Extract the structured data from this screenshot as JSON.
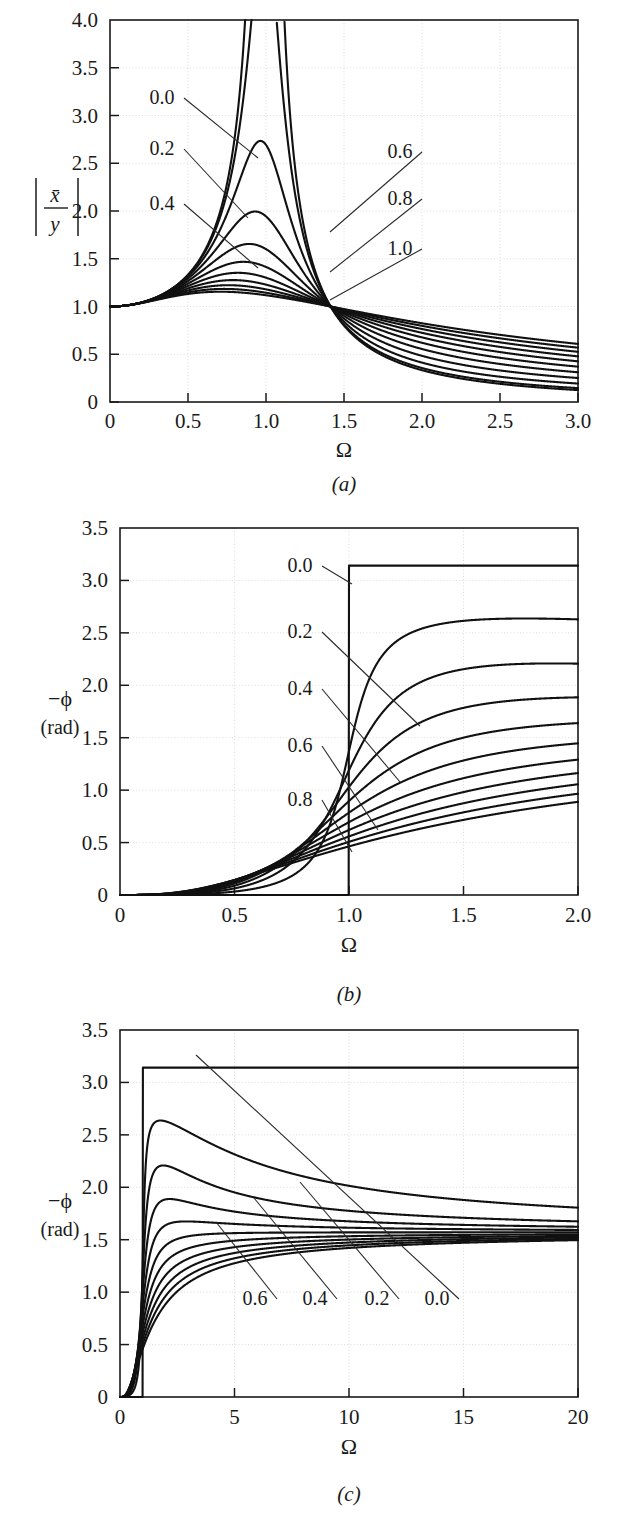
{
  "figure": {
    "name": "displacement-transmissibility-figure",
    "panel_count": 3
  },
  "chart_data": [
    {
      "id": "a",
      "type": "line",
      "title": "",
      "caption": "(a)",
      "xlabel": "Ω",
      "ylabel": "|x̄/y|",
      "ylabel_parts": {
        "numerator": "x̄",
        "denominator": "y"
      },
      "xlim": [
        0,
        3.0
      ],
      "ylim": [
        0,
        4.0
      ],
      "xticks": [
        0,
        0.5,
        1.0,
        1.5,
        2.0,
        2.5,
        3.0
      ],
      "xtick_labels": [
        "0",
        "0.5",
        "1.0",
        "1.5",
        "2.0",
        "2.5",
        "3.0"
      ],
      "yticks": [
        0,
        0.5,
        1.0,
        1.5,
        2.0,
        2.5,
        3.0,
        3.5,
        4.0
      ],
      "ytick_labels": [
        "0",
        "0.5",
        "1.0",
        "1.5",
        "2.0",
        "2.5",
        "3.0",
        "3.5",
        "4.0"
      ],
      "grid": true,
      "legend": "inline-labels",
      "curve_param_name": "ζ",
      "curve_params": [
        0.0,
        0.1,
        0.2,
        0.3,
        0.4,
        0.5,
        0.6,
        0.7,
        0.8,
        0.9,
        1.0
      ],
      "formula": "transmissibility",
      "annotations": [
        {
          "label": "0.0",
          "x": 162,
          "y": 104,
          "lead_to_x": 258,
          "lead_to_y": 158
        },
        {
          "label": "0.2",
          "x": 162,
          "y": 155,
          "lead_to_x": 248,
          "lead_to_y": 218
        },
        {
          "label": "0.4",
          "x": 162,
          "y": 210,
          "lead_to_x": 258,
          "lead_to_y": 268
        },
        {
          "label": "0.6",
          "x": 400,
          "y": 158,
          "lead_to_x": 330,
          "lead_to_y": 232
        },
        {
          "label": "0.8",
          "x": 400,
          "y": 205,
          "lead_to_x": 330,
          "lead_to_y": 272
        },
        {
          "label": "1.0",
          "x": 400,
          "y": 255,
          "lead_to_x": 330,
          "lead_to_y": 300
        }
      ],
      "notes": "Magnitude of displacement transmissibility; all curves pass through 1.0 at Ω=0 and cross at Ω=√2≈1.414 where ratio = 1."
    },
    {
      "id": "b",
      "type": "line",
      "title": "",
      "caption": "(b)",
      "xlabel": "Ω",
      "ylabel": "−ϕ",
      "ylabel_unit": "(rad)",
      "xlim": [
        0,
        2.0
      ],
      "ylim": [
        0,
        3.5
      ],
      "xticks": [
        0,
        0.5,
        1.0,
        1.5,
        2.0
      ],
      "xtick_labels": [
        "0",
        "0.5",
        "1.0",
        "1.5",
        "2.0"
      ],
      "yticks": [
        0,
        0.5,
        1.0,
        1.5,
        2.0,
        2.5,
        3.0,
        3.5
      ],
      "ytick_labels": [
        "0",
        "0.5",
        "1.0",
        "1.5",
        "2.0",
        "2.5",
        "3.0",
        "3.5"
      ],
      "grid": true,
      "legend": "inline-labels",
      "curve_param_name": "ζ",
      "curve_params": [
        0.0,
        0.1,
        0.2,
        0.3,
        0.4,
        0.5,
        0.6,
        0.7,
        0.8,
        0.9,
        1.0
      ],
      "formula": "phase",
      "annotations": [
        {
          "label": "0.0",
          "x": 300,
          "y": 572,
          "lead_to_x": 352,
          "lead_to_y": 584
        },
        {
          "label": "0.2",
          "x": 300,
          "y": 638,
          "lead_to_x": 420,
          "lead_to_y": 726
        },
        {
          "label": "0.4",
          "x": 300,
          "y": 695,
          "lead_to_x": 400,
          "lead_to_y": 782
        },
        {
          "label": "0.6",
          "x": 300,
          "y": 752,
          "lead_to_x": 378,
          "lead_to_y": 830
        },
        {
          "label": "0.8",
          "x": 300,
          "y": 806,
          "lead_to_x": 352,
          "lead_to_y": 852
        }
      ],
      "notes": "Phase angle of transmissibility in radians; undamped case is a step from 0 to π at Ω=1."
    },
    {
      "id": "c",
      "type": "line",
      "title": "",
      "caption": "(c)",
      "xlabel": "Ω",
      "ylabel": "−ϕ",
      "ylabel_unit": "(rad)",
      "xlim": [
        0,
        20
      ],
      "ylim": [
        0,
        3.5
      ],
      "xticks": [
        0,
        5,
        10,
        15,
        20
      ],
      "xtick_labels": [
        "0",
        "5",
        "10",
        "15",
        "20"
      ],
      "yticks": [
        0,
        0.5,
        1.0,
        1.5,
        2.0,
        2.5,
        3.0,
        3.5
      ],
      "ytick_labels": [
        "0",
        "0.5",
        "1.0",
        "1.5",
        "2.0",
        "2.5",
        "3.0",
        "3.5"
      ],
      "grid": true,
      "legend": "inline-labels",
      "curve_param_name": "ζ",
      "curve_params": [
        0.0,
        0.1,
        0.2,
        0.3,
        0.4,
        0.5,
        0.6,
        0.7,
        0.8,
        0.9,
        1.0
      ],
      "formula": "phase",
      "annotations": [
        {
          "label": "0.6",
          "x": 255,
          "y": 1305,
          "lead_to_x": 216,
          "lead_to_y": 1222
        },
        {
          "label": "0.4",
          "x": 315,
          "y": 1305,
          "lead_to_x": 254,
          "lead_to_y": 1198
        },
        {
          "label": "0.2",
          "x": 377,
          "y": 1305,
          "lead_to_x": 300,
          "lead_to_y": 1182
        },
        {
          "label": "0.0",
          "x": 437,
          "y": 1305,
          "lead_to_x": 196,
          "lead_to_y": 1055
        }
      ],
      "notes": "Same phase data as (b) but plotted over a wide frequency range 0–20; curves peak then decay toward π/2."
    }
  ],
  "colors": {
    "curve": "#111111",
    "axis": "#1a1a1a",
    "grid": "#d8d8d8",
    "background": "#ffffff"
  }
}
